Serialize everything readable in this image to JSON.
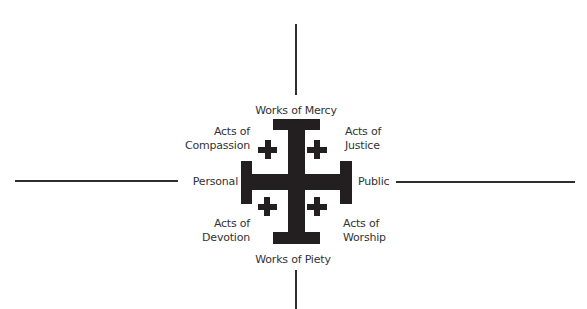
{
  "diagram": {
    "type": "quadrant cross diagram",
    "center_symbol": "jerusalem-cross",
    "colors": {
      "cross": "#231f20",
      "axis": "#2e2e2e",
      "text": "#333333",
      "background": "#ffffff"
    },
    "axes": {
      "top": "Works of Mercy",
      "bottom": "Works of Piety",
      "left": "Personal",
      "right": "Public"
    },
    "quadrants": {
      "top_left": {
        "line1": "Acts of",
        "line2": "Compassion"
      },
      "top_right": {
        "line1": "Acts of",
        "line2": "Justice"
      },
      "bottom_left": {
        "line1": "Acts of",
        "line2": "Devotion"
      },
      "bottom_right": {
        "line1": "Acts of",
        "line2": "Worship"
      }
    }
  }
}
